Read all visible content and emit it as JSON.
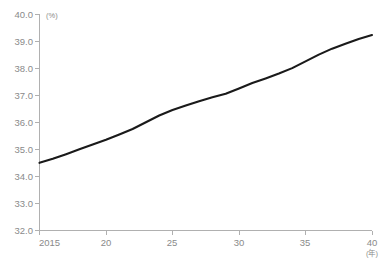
{
  "chart_data": {
    "type": "line",
    "title": "",
    "subtitle": "",
    "xlabel": "(年)",
    "ylabel": "(%)",
    "xlim": [
      2015,
      2040
    ],
    "ylim": [
      32.0,
      40.0
    ],
    "grid": false,
    "legend": null,
    "y_ticks": [
      "40.0",
      "39.0",
      "38.0",
      "37.0",
      "36.0",
      "35.0",
      "34.0",
      "33.0",
      "32.0"
    ],
    "y_tick_values": [
      40.0,
      39.0,
      38.0,
      37.0,
      36.0,
      35.0,
      34.0,
      33.0,
      32.0
    ],
    "x_ticks": [
      "2015",
      "20",
      "25",
      "30",
      "35",
      "40"
    ],
    "x_tick_values": [
      2015,
      2020,
      2025,
      2030,
      2035,
      2040
    ],
    "series": [
      {
        "name": "",
        "color": "#1a1a1a",
        "x": [
          2015,
          2016,
          2017,
          2018,
          2019,
          2020,
          2021,
          2022,
          2023,
          2024,
          2025,
          2026,
          2027,
          2028,
          2029,
          2030,
          2031,
          2032,
          2033,
          2034,
          2035,
          2036,
          2037,
          2038,
          2039,
          2040
        ],
        "values": [
          34.5,
          34.65,
          34.82,
          35.0,
          35.18,
          35.35,
          35.55,
          35.75,
          36.0,
          36.25,
          36.45,
          36.62,
          36.78,
          36.92,
          37.05,
          37.25,
          37.45,
          37.62,
          37.8,
          38.0,
          38.25,
          38.5,
          38.72,
          38.9,
          39.08,
          39.22
        ]
      }
    ]
  },
  "axes": {
    "y_unit": "(%)",
    "x_unit": "(年)"
  }
}
